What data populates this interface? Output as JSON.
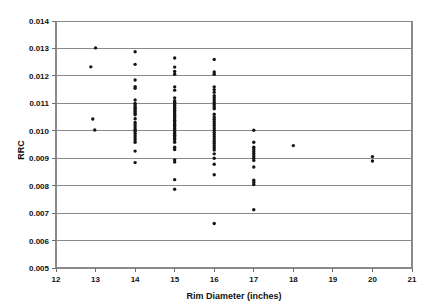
{
  "chart_data": {
    "type": "scatter",
    "title": "",
    "xlabel": "Rim Diameter (inches)",
    "ylabel": "RRC",
    "xlim": [
      12,
      21
    ],
    "ylim": [
      0.005,
      0.014
    ],
    "grid": true,
    "grid_axis": "y",
    "legend": "none",
    "marker": "dot",
    "marker_color": "#151515",
    "xticks": [
      12,
      13,
      14,
      15,
      16,
      17,
      18,
      19,
      20,
      21
    ],
    "xtick_labels": [
      "12",
      "13",
      "14",
      "15",
      "16",
      "17",
      "18",
      "19",
      "20",
      "21"
    ],
    "yticks": [
      0.005,
      0.006,
      0.007,
      0.008,
      0.009,
      0.01,
      0.011,
      0.012,
      0.013,
      0.014
    ],
    "ytick_labels": [
      "0.005",
      "0.006",
      "0.007",
      "0.008",
      "0.009",
      "0.010",
      "0.011",
      "0.012",
      "0.013",
      "0.014"
    ],
    "series": [
      {
        "name": "RRC by rim diameter",
        "points": [
          [
            13.0,
            0.01302
          ],
          [
            12.88,
            0.01233
          ],
          [
            12.93,
            0.01043
          ],
          [
            12.98,
            0.01003
          ],
          [
            14.0,
            0.01288
          ],
          [
            14.0,
            0.01242
          ],
          [
            14.0,
            0.01185
          ],
          [
            14.0,
            0.01161
          ],
          [
            14.0,
            0.01155
          ],
          [
            14.0,
            0.01112
          ],
          [
            14.0,
            0.011
          ],
          [
            14.0,
            0.01094
          ],
          [
            14.0,
            0.01088
          ],
          [
            14.0,
            0.01082
          ],
          [
            14.0,
            0.01076
          ],
          [
            14.0,
            0.0107
          ],
          [
            14.0,
            0.01064
          ],
          [
            14.0,
            0.01058
          ],
          [
            14.0,
            0.01044
          ],
          [
            14.0,
            0.0103
          ],
          [
            14.0,
            0.01022
          ],
          [
            14.0,
            0.01014
          ],
          [
            14.0,
            0.01006
          ],
          [
            14.0,
            0.00998
          ],
          [
            14.0,
            0.0099
          ],
          [
            14.0,
            0.00982
          ],
          [
            14.0,
            0.00974
          ],
          [
            14.0,
            0.00966
          ],
          [
            14.0,
            0.00958
          ],
          [
            14.0,
            0.00926
          ],
          [
            14.0,
            0.00884
          ],
          [
            15.0,
            0.01265
          ],
          [
            15.0,
            0.01232
          ],
          [
            15.0,
            0.01216
          ],
          [
            15.0,
            0.01206
          ],
          [
            15.0,
            0.0116
          ],
          [
            15.0,
            0.01148
          ],
          [
            15.0,
            0.0112
          ],
          [
            15.0,
            0.0111
          ],
          [
            15.0,
            0.01104
          ],
          [
            15.0,
            0.01098
          ],
          [
            15.0,
            0.01092
          ],
          [
            15.0,
            0.01086
          ],
          [
            15.0,
            0.0108
          ],
          [
            15.0,
            0.01074
          ],
          [
            15.0,
            0.01068
          ],
          [
            15.0,
            0.01062
          ],
          [
            15.0,
            0.01056
          ],
          [
            15.0,
            0.0105
          ],
          [
            15.0,
            0.01044
          ],
          [
            15.0,
            0.01038
          ],
          [
            15.0,
            0.01032
          ],
          [
            15.0,
            0.01026
          ],
          [
            15.0,
            0.0102
          ],
          [
            15.0,
            0.01014
          ],
          [
            15.0,
            0.01008
          ],
          [
            15.0,
            0.01002
          ],
          [
            15.0,
            0.00996
          ],
          [
            15.0,
            0.0099
          ],
          [
            15.0,
            0.00984
          ],
          [
            15.0,
            0.00978
          ],
          [
            15.0,
            0.00972
          ],
          [
            15.0,
            0.00966
          ],
          [
            15.0,
            0.00958
          ],
          [
            15.0,
            0.0094
          ],
          [
            15.0,
            0.00932
          ],
          [
            15.0,
            0.00894
          ],
          [
            15.0,
            0.00886
          ],
          [
            15.0,
            0.00822
          ],
          [
            15.0,
            0.00787
          ],
          [
            16.0,
            0.0126
          ],
          [
            16.0,
            0.01214
          ],
          [
            16.0,
            0.01206
          ],
          [
            16.0,
            0.0116
          ],
          [
            16.0,
            0.0115
          ],
          [
            16.0,
            0.0114
          ],
          [
            16.0,
            0.01128
          ],
          [
            16.0,
            0.0112
          ],
          [
            16.0,
            0.01112
          ],
          [
            16.0,
            0.01104
          ],
          [
            16.0,
            0.01096
          ],
          [
            16.0,
            0.01088
          ],
          [
            16.0,
            0.0108
          ],
          [
            16.0,
            0.0106
          ],
          [
            16.0,
            0.0105
          ],
          [
            16.0,
            0.01042
          ],
          [
            16.0,
            0.01034
          ],
          [
            16.0,
            0.01026
          ],
          [
            16.0,
            0.01018
          ],
          [
            16.0,
            0.0101
          ],
          [
            16.0,
            0.01002
          ],
          [
            16.0,
            0.00994
          ],
          [
            16.0,
            0.00986
          ],
          [
            16.0,
            0.00978
          ],
          [
            16.0,
            0.0097
          ],
          [
            16.0,
            0.00962
          ],
          [
            16.0,
            0.00954
          ],
          [
            16.0,
            0.00946
          ],
          [
            16.0,
            0.00938
          ],
          [
            16.0,
            0.0093
          ],
          [
            16.0,
            0.00916
          ],
          [
            16.0,
            0.009
          ],
          [
            16.0,
            0.00878
          ],
          [
            16.0,
            0.0084
          ],
          [
            16.0,
            0.00662
          ],
          [
            17.0,
            0.01002
          ],
          [
            17.0,
            0.00958
          ],
          [
            17.0,
            0.0094
          ],
          [
            17.0,
            0.00932
          ],
          [
            17.0,
            0.00924
          ],
          [
            17.0,
            0.00916
          ],
          [
            17.0,
            0.00908
          ],
          [
            17.0,
            0.009
          ],
          [
            17.0,
            0.00892
          ],
          [
            17.0,
            0.00868
          ],
          [
            17.0,
            0.0082
          ],
          [
            17.0,
            0.00812
          ],
          [
            17.0,
            0.00804
          ],
          [
            17.0,
            0.00712
          ],
          [
            18.0,
            0.00946
          ],
          [
            20.0,
            0.00906
          ],
          [
            20.0,
            0.0089
          ]
        ]
      }
    ]
  },
  "axes": {
    "y_axis_label": "RRC",
    "x_axis_label": "Rim Diameter (inches)"
  }
}
